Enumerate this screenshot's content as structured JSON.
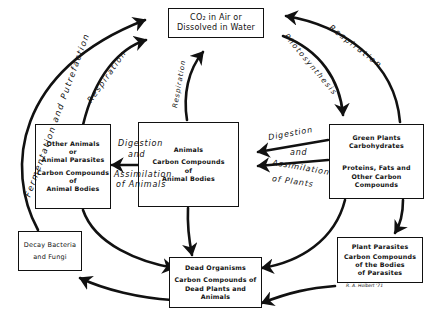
{
  "diagram": {
    "nodes": {
      "co2": {
        "line1": "CO₂ in Air or",
        "line2": "Dissolved in Water"
      },
      "green_plants": {
        "line1": "Green Plants",
        "line2": "Carbohydrates",
        "line3": "Proteins, Fats and",
        "line4": "Other Carbon Compounds"
      },
      "animals": {
        "line1": "Animals",
        "line2": "Carbon Compounds",
        "line3": "of",
        "line4": "Animal Bodies"
      },
      "other_animals": {
        "line1": "Other Animals",
        "line2": "or",
        "line3": "Animal Parasites",
        "line4": "Carbon Compounds",
        "line5": "of",
        "line6": "Animal Bodies"
      },
      "plant_parasites": {
        "line1": "Plant Parasites",
        "line2": "Carbon Compounds",
        "line3": "of the Bodies",
        "line4": "of Parasites"
      },
      "dead_organisms": {
        "line1": "Dead Organisms",
        "line2": "Carbon Compounds of",
        "line3": "Dead Plants and Animals"
      },
      "decay": {
        "line1": "Decay Bacteria",
        "line2": "and Fungi"
      }
    },
    "edges": {
      "fermentation": "Fermentation and Putrefaction",
      "respiration_left": "Respiration",
      "respiration_center": "Respiration",
      "respiration_right": "Respiration",
      "photosynthesis": "Photosynthesis",
      "digestion_animals_1": "Digestion",
      "digestion_animals_2": "and",
      "digestion_animals_3": "Assimilation",
      "digestion_animals_4": "of Animals",
      "digestion_plants_1": "Digestion",
      "digestion_plants_2": "and",
      "digestion_plants_3": "Assimilation",
      "digestion_plants_4": "of Plants"
    },
    "signature": "R. A. Holbert '71"
  }
}
